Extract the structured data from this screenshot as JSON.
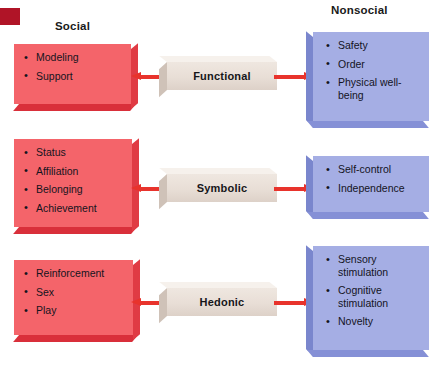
{
  "figure": {
    "headers": {
      "left": "Social",
      "right": "Nonsocial"
    },
    "marker": "page-color-marker",
    "colors": {
      "social_box": "#f4646a",
      "social_box_shadow": "#d92f3a",
      "nonsocial_box": "#a5aee4",
      "nonsocial_box_shadow": "#7a86cd",
      "center_block": "#e8ded6",
      "arrow": "#e8332c",
      "marker": "#b01427",
      "text": "#14141e"
    },
    "rows": [
      {
        "center_label": "Functional",
        "left_arrow": "arrow-left-icon",
        "right_arrow": "arrow-right-icon",
        "social_items": [
          "Modeling",
          "Support"
        ],
        "nonsocial_items": [
          "Safety",
          "Order",
          "Physical well-being"
        ]
      },
      {
        "center_label": "Symbolic",
        "left_arrow": "arrow-left-icon",
        "right_arrow": "arrow-right-icon",
        "social_items": [
          "Status",
          "Affiliation",
          "Belonging",
          "Achievement"
        ],
        "nonsocial_items": [
          "Self-control",
          "Independence"
        ]
      },
      {
        "center_label": "Hedonic",
        "left_arrow": "arrow-left-icon",
        "right_arrow": "arrow-right-icon",
        "social_items": [
          "Reinforcement",
          "Sex",
          "Play"
        ],
        "nonsocial_items": [
          "Sensory stimulation",
          "Cognitive stimulation",
          "Novelty"
        ]
      }
    ]
  }
}
